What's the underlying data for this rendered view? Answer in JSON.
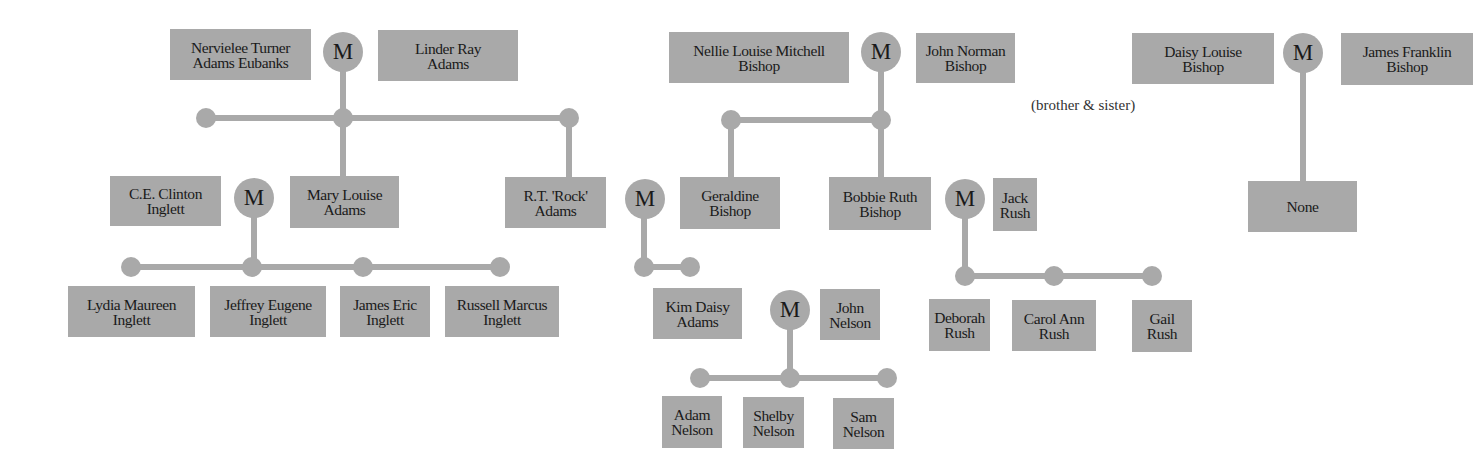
{
  "diagram": {
    "type": "family-tree",
    "marriage_symbol": "M",
    "colors": {
      "box": "#a9a9a9",
      "line": "#a9a9a9",
      "text": "#1a1a1a"
    },
    "annotation": "(brother & sister)",
    "people": {
      "nervielee": "Nervielee Turner\nAdams Eubanks",
      "linder": "Linder Ray\nAdams",
      "nellie": "Nellie Louise Mitchell\nBishop",
      "john_norman": "John Norman\nBishop",
      "daisy_louise": "Daisy Louise\nBishop",
      "james_franklin": "James Franklin\nBishop",
      "ce_clinton": "C.E. Clinton\nInglett",
      "mary_louise": "Mary Louise\nAdams",
      "rock": "R.T. 'Rock'\nAdams",
      "geraldine": "Geraldine\nBishop",
      "bobbie_ruth": "Bobbie Ruth\nBishop",
      "jack_rush": "Jack\nRush",
      "none": "None",
      "lydia": "Lydia Maureen\nInglett",
      "jeffrey": "Jeffrey Eugene\nInglett",
      "james_eric": "James Eric\nInglett",
      "russell": "Russell Marcus\nInglett",
      "kim_daisy": "Kim Daisy\nAdams",
      "john_nelson": "John\nNelson",
      "deborah": "Deborah\nRush",
      "carol_ann": "Carol Ann\nRush",
      "gail": "Gail\nRush",
      "adam": "Adam\nNelson",
      "shelby": "Shelby\nNelson",
      "sam": "Sam\nNelson"
    },
    "marriages": [
      {
        "id": "m1",
        "label": "M",
        "spouses": [
          "Nervielee Turner Adams Eubanks",
          "Linder Ray Adams"
        ],
        "children": [
          "Mary Louise Adams",
          "R.T. 'Rock' Adams"
        ]
      },
      {
        "id": "m2",
        "label": "M",
        "spouses": [
          "Nellie Louise Mitchell Bishop",
          "John Norman Bishop"
        ],
        "children": [
          "Geraldine Bishop",
          "Bobbie Ruth Bishop"
        ]
      },
      {
        "id": "m3",
        "label": "M",
        "spouses": [
          "Daisy Louise Bishop",
          "James Franklin Bishop"
        ],
        "children": [
          "None"
        ],
        "note": "(brother & sister)"
      },
      {
        "id": "m4",
        "label": "M",
        "spouses": [
          "C.E. Clinton Inglett",
          "Mary Louise Adams"
        ],
        "children": [
          "Lydia Maureen Inglett",
          "Jeffrey Eugene Inglett",
          "James Eric Inglett",
          "Russell Marcus Inglett"
        ]
      },
      {
        "id": "m5",
        "label": "M",
        "spouses": [
          "R.T. 'Rock' Adams",
          "Geraldine Bishop"
        ],
        "children": [
          "Kim Daisy Adams"
        ]
      },
      {
        "id": "m6",
        "label": "M",
        "spouses": [
          "Bobbie Ruth Bishop",
          "Jack Rush"
        ],
        "children": [
          "Deborah Rush",
          "Carol Ann Rush",
          "Gail Rush"
        ]
      },
      {
        "id": "m7",
        "label": "M",
        "spouses": [
          "Kim Daisy Adams",
          "John Nelson"
        ],
        "children": [
          "Adam Nelson",
          "Shelby Nelson",
          "Sam Nelson"
        ]
      }
    ]
  }
}
